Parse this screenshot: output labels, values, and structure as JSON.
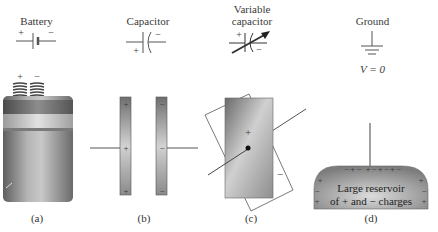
{
  "panels": [
    {
      "id": "a",
      "title": "Battery",
      "caption": "(a)",
      "symbol": {
        "plus": "+",
        "minus": "−"
      },
      "terminals": {
        "plus": "+",
        "minus": "−"
      }
    },
    {
      "id": "b",
      "title": "Capacitor",
      "caption": "(b)",
      "symbol": {
        "plus": "+",
        "minus": "−"
      },
      "left_plate_charges": [
        "+",
        "+",
        "+"
      ],
      "right_plate_charges": [
        "−",
        "−",
        "−"
      ]
    },
    {
      "id": "c",
      "title_line1": "Variable",
      "title_line2": "capacitor",
      "caption": "(c)",
      "symbol": {
        "plus": "+",
        "minus": "−"
      },
      "front_plate_charge": "+",
      "back_plate_charge": "−"
    },
    {
      "id": "d",
      "title": "Ground",
      "caption": "(d)",
      "potential_label": "V = 0",
      "reservoir_line1": "Large reservoir",
      "reservoir_line2": "of + and − charges",
      "surface_charges": "−+− +−+−+−"
    }
  ],
  "colors": {
    "line": "#444444",
    "plate_dark": "#7a7a7a",
    "plate_light": "#d8d8d8",
    "battery_body": "#8a8a8a",
    "battery_band": "#bdbdbd",
    "background": "#ffffff"
  }
}
